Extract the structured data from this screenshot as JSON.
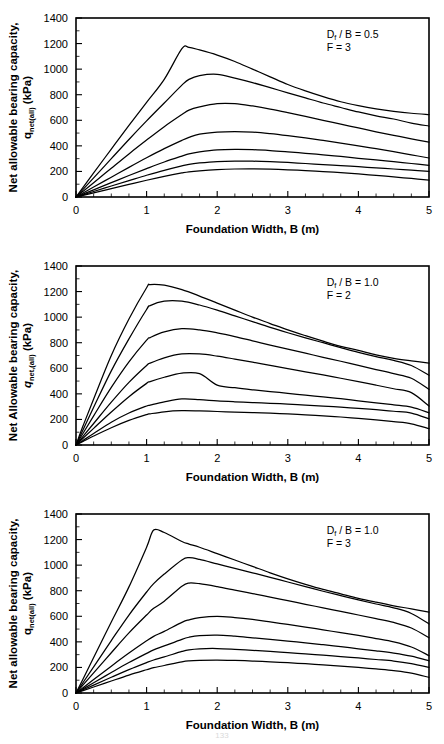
{
  "page": {
    "page_number": "133",
    "panel_count": 3
  },
  "chart_data": [
    {
      "type": "line",
      "title": "",
      "xlabel": "Foundation Width, B (m)",
      "ylabel_line1": "Net allowable bearing capacity,",
      "ylabel_line2_main": "q",
      "ylabel_line2_sub": "net(all)",
      "ylabel_line2_tail": " (kPa)",
      "ylabel_italic": false,
      "xlim": [
        0,
        5
      ],
      "ylim": [
        0,
        1400
      ],
      "xticks": [
        0,
        1,
        2,
        3,
        4,
        5
      ],
      "yticks": [
        0,
        200,
        400,
        600,
        800,
        1000,
        1200,
        1400
      ],
      "xtick_labels": [
        "0",
        "1",
        "2",
        "3",
        "4",
        "5"
      ],
      "ytick_labels": [
        "0",
        "200",
        "400",
        "600",
        "800",
        "1000",
        "1200",
        "1400"
      ],
      "x_minor_step": 0.25,
      "y_minor_step": 100,
      "grid": false,
      "legend": "none",
      "annotations": [
        {
          "text_main": "D",
          "text_sub": "f",
          "text_tail": " / B = 0.5",
          "x": 3.55,
          "y": 1245
        },
        {
          "text_main": "F = 3",
          "text_sub": "",
          "text_tail": "",
          "x": 3.55,
          "y": 1145
        }
      ],
      "x": [
        0,
        0.1,
        0.25,
        0.5,
        0.75,
        1.0,
        1.25,
        1.5,
        1.6,
        1.75,
        2.0,
        2.25,
        2.5,
        2.75,
        3.0,
        3.25,
        3.5,
        3.75,
        4.0,
        4.25,
        4.5,
        4.75,
        5.0
      ],
      "series": [
        {
          "name": "curve-1",
          "values": [
            0,
            75,
            188,
            375,
            560,
            740,
            920,
            1160,
            1170,
            1150,
            1110,
            1060,
            1000,
            940,
            880,
            830,
            785,
            745,
            715,
            690,
            670,
            655,
            645
          ]
        },
        {
          "name": "curve-2",
          "values": [
            0,
            60,
            150,
            300,
            450,
            595,
            735,
            875,
            920,
            950,
            960,
            930,
            895,
            855,
            815,
            775,
            735,
            700,
            665,
            635,
            610,
            578,
            555
          ]
        },
        {
          "name": "curve-3",
          "values": [
            0,
            45,
            112,
            225,
            337,
            445,
            550,
            645,
            680,
            705,
            730,
            730,
            712,
            688,
            660,
            630,
            600,
            570,
            540,
            510,
            482,
            455,
            430
          ]
        },
        {
          "name": "curve-4",
          "values": [
            0,
            31,
            78,
            155,
            232,
            307,
            378,
            443,
            466,
            492,
            508,
            512,
            508,
            496,
            480,
            462,
            443,
            422,
            400,
            378,
            355,
            330,
            305
          ]
        },
        {
          "name": "curve-5",
          "values": [
            0,
            22,
            56,
            112,
            168,
            222,
            274,
            320,
            337,
            352,
            368,
            372,
            370,
            363,
            353,
            342,
            330,
            317,
            303,
            290,
            276,
            262,
            248
          ]
        },
        {
          "name": "curve-6",
          "values": [
            0,
            17,
            43,
            86,
            128,
            170,
            209,
            244,
            256,
            266,
            277,
            281,
            280,
            276,
            270,
            262,
            254,
            246,
            237,
            228,
            219,
            210,
            200
          ]
        },
        {
          "name": "curve-7",
          "values": [
            0,
            13,
            33,
            66,
            99,
            131,
            161,
            188,
            197,
            205,
            214,
            219,
            220,
            218,
            213,
            206,
            199,
            190,
            180,
            169,
            157,
            145,
            132
          ]
        }
      ]
    },
    {
      "type": "line",
      "title": "",
      "xlabel": "Foundation Width, B (m)",
      "ylabel_line1": "Net Allowable bearing capacity,",
      "ylabel_line2_main": "q",
      "ylabel_line2_sub": "net,(all)",
      "ylabel_line2_tail": " (kPa)",
      "ylabel_italic": true,
      "xlim": [
        0,
        5
      ],
      "ylim": [
        0,
        1400
      ],
      "xticks": [
        0,
        1,
        2,
        3,
        4,
        5
      ],
      "yticks": [
        0,
        200,
        400,
        600,
        800,
        1000,
        1200,
        1400
      ],
      "xtick_labels": [
        "0",
        "1",
        "2",
        "3",
        "4",
        "5"
      ],
      "ytick_labels": [
        "0",
        "200",
        "400",
        "600",
        "800",
        "1000",
        "1200",
        "1400"
      ],
      "x_minor_step": 0.25,
      "y_minor_step": 100,
      "grid": false,
      "legend": "none",
      "annotations": [
        {
          "text_main": "D",
          "text_sub": "f",
          "text_tail": " / B = 1.0",
          "x": 3.55,
          "y": 1245
        },
        {
          "text_main": "F = 2",
          "text_sub": "",
          "text_tail": "",
          "x": 3.55,
          "y": 1145
        }
      ],
      "x": [
        0,
        0.1,
        0.25,
        0.5,
        0.75,
        1.0,
        1.05,
        1.25,
        1.5,
        1.75,
        2.0,
        2.25,
        2.5,
        2.75,
        3.0,
        3.25,
        3.5,
        3.75,
        4.0,
        4.25,
        4.5,
        4.75,
        5.0
      ],
      "series": [
        {
          "name": "curve-1",
          "values": [
            0,
            150,
            360,
            700,
            985,
            1230,
            1255,
            1250,
            1215,
            1165,
            1110,
            1055,
            1000,
            950,
            900,
            855,
            812,
            772,
            740,
            705,
            678,
            658,
            640
          ]
        },
        {
          "name": "curve-2",
          "values": [
            0,
            120,
            295,
            580,
            830,
            1060,
            1090,
            1125,
            1125,
            1095,
            1055,
            1010,
            965,
            920,
            878,
            838,
            800,
            762,
            725,
            692,
            662,
            622,
            545
          ]
        },
        {
          "name": "curve-3",
          "values": [
            0,
            92,
            228,
            450,
            650,
            820,
            840,
            885,
            910,
            900,
            877,
            848,
            815,
            782,
            750,
            718,
            686,
            655,
            622,
            590,
            558,
            522,
            435
          ]
        },
        {
          "name": "curve-4",
          "values": [
            0,
            68,
            168,
            335,
            490,
            622,
            640,
            682,
            712,
            712,
            695,
            672,
            648,
            622,
            597,
            572,
            548,
            522,
            496,
            468,
            440,
            410,
            305
          ]
        },
        {
          "name": "curve-5",
          "values": [
            0,
            53,
            130,
            258,
            378,
            482,
            496,
            530,
            562,
            558,
            468,
            448,
            432,
            418,
            404,
            390,
            376,
            362,
            346,
            330,
            314,
            296,
            252
          ]
        },
        {
          "name": "curve-6",
          "values": [
            0,
            36,
            90,
            178,
            250,
            305,
            312,
            338,
            360,
            355,
            345,
            338,
            332,
            326,
            320,
            312,
            304,
            296,
            286,
            276,
            264,
            250,
            205
          ]
        },
        {
          "name": "curve-7",
          "values": [
            0,
            28,
            70,
            135,
            192,
            238,
            244,
            260,
            268,
            266,
            262,
            258,
            254,
            249,
            243,
            236,
            228,
            219,
            208,
            196,
            182,
            166,
            128
          ]
        }
      ]
    },
    {
      "type": "line",
      "title": "",
      "xlabel": "Foundation Width, B (m)",
      "ylabel_line1": "Net allowable bearing capacity,",
      "ylabel_line2_main": "q",
      "ylabel_line2_sub": "net(all)",
      "ylabel_line2_tail": " (kPa)",
      "ylabel_italic": false,
      "xlim": [
        0,
        5
      ],
      "ylim": [
        0,
        1400
      ],
      "xticks": [
        0,
        1,
        2,
        3,
        4,
        5
      ],
      "yticks": [
        0,
        200,
        400,
        600,
        800,
        1000,
        1200,
        1400
      ],
      "xtick_labels": [
        "0",
        "1",
        "2",
        "3",
        "4",
        "5"
      ],
      "ytick_labels": [
        "0",
        "200",
        "400",
        "600",
        "800",
        "1000",
        "1200",
        "1400"
      ],
      "x_minor_step": 0.25,
      "y_minor_step": 100,
      "grid": false,
      "legend": "none",
      "annotations": [
        {
          "text_main": "D",
          "text_sub": "f",
          "text_tail": " / B = 1.0",
          "x": 3.55,
          "y": 1245
        },
        {
          "text_main": "F = 3",
          "text_sub": "",
          "text_tail": "",
          "x": 3.55,
          "y": 1145
        }
      ],
      "x": [
        0,
        0.1,
        0.25,
        0.5,
        0.75,
        1.0,
        1.1,
        1.25,
        1.5,
        1.6,
        1.75,
        2.0,
        2.25,
        2.5,
        2.75,
        3.0,
        3.25,
        3.5,
        3.75,
        4.0,
        4.25,
        4.5,
        4.75,
        5.0
      ],
      "series": [
        {
          "name": "curve-1",
          "values": [
            0,
            110,
            278,
            555,
            830,
            1140,
            1275,
            1255,
            1185,
            1165,
            1140,
            1090,
            1040,
            990,
            940,
            893,
            850,
            810,
            775,
            740,
            710,
            682,
            658,
            632
          ]
        },
        {
          "name": "curve-2",
          "values": [
            0,
            82,
            205,
            410,
            610,
            790,
            855,
            930,
            1040,
            1058,
            1045,
            1010,
            975,
            940,
            905,
            868,
            832,
            796,
            762,
            728,
            696,
            666,
            622,
            540
          ]
        },
        {
          "name": "curve-3",
          "values": [
            0,
            63,
            158,
            315,
            470,
            610,
            662,
            718,
            835,
            860,
            855,
            832,
            805,
            778,
            750,
            722,
            694,
            666,
            638,
            610,
            582,
            552,
            508,
            432
          ]
        },
        {
          "name": "curve-4",
          "values": [
            0,
            42,
            105,
            210,
            312,
            408,
            443,
            482,
            552,
            572,
            590,
            600,
            590,
            575,
            556,
            536,
            516,
            494,
            472,
            450,
            426,
            400,
            360,
            292
          ]
        },
        {
          "name": "curve-5",
          "values": [
            0,
            32,
            80,
            160,
            238,
            310,
            337,
            368,
            420,
            436,
            448,
            452,
            444,
            432,
            420,
            406,
            392,
            378,
            362,
            346,
            330,
            312,
            288,
            252
          ]
        },
        {
          "name": "curve-6",
          "values": [
            0,
            25,
            62,
            123,
            183,
            238,
            258,
            282,
            325,
            338,
            346,
            348,
            342,
            334,
            325,
            316,
            306,
            296,
            285,
            274,
            262,
            250,
            230,
            200
          ]
        },
        {
          "name": "curve-7",
          "values": [
            0,
            19,
            47,
            94,
            140,
            182,
            198,
            215,
            244,
            252,
            256,
            258,
            255,
            250,
            244,
            237,
            229,
            220,
            211,
            200,
            188,
            175,
            156,
            122
          ]
        }
      ]
    }
  ]
}
